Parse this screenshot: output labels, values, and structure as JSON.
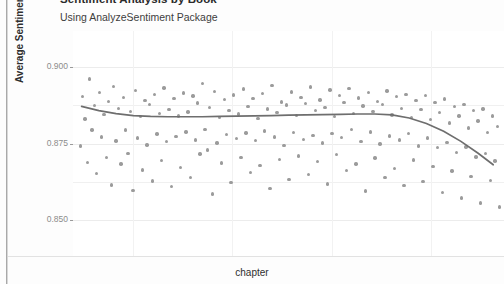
{
  "figure": {
    "title": "Sentiment Analysis by Book",
    "subtitle": "Using AnalyzeSentiment Package",
    "x_axis_label": "chapter",
    "y_axis_label": "Average Sentiment"
  },
  "chart_data": {
    "type": "scatter",
    "title": "Sentiment Analysis by Book",
    "subtitle": "Using AnalyzeSentiment Package",
    "xlabel": "chapter",
    "ylabel": "Average Sentiment",
    "grid": true,
    "legend": "none",
    "xlim": [
      0,
      1
    ],
    "ylim": [
      0.838,
      0.912
    ],
    "x_tick_labels": [],
    "y_ticks": [
      0.85,
      0.875,
      0.9
    ],
    "y_tick_labels": [
      "0.850",
      "0.875",
      "0.900"
    ],
    "point_color": "#9b9b9b",
    "trend_color": "#6e6e6e",
    "series": [
      {
        "name": "chapter sentiment",
        "type": "scatter",
        "points": [
          [
            0.018,
            0.8742
          ],
          [
            0.022,
            0.8905
          ],
          [
            0.028,
            0.8831
          ],
          [
            0.034,
            0.8688
          ],
          [
            0.039,
            0.8962
          ],
          [
            0.044,
            0.8795
          ],
          [
            0.05,
            0.8874
          ],
          [
            0.055,
            0.8651
          ],
          [
            0.061,
            0.8918
          ],
          [
            0.066,
            0.8772
          ],
          [
            0.072,
            0.8845
          ],
          [
            0.078,
            0.8704
          ],
          [
            0.083,
            0.8889
          ],
          [
            0.089,
            0.8613
          ],
          [
            0.094,
            0.8938
          ],
          [
            0.1,
            0.8758
          ],
          [
            0.105,
            0.8866
          ],
          [
            0.111,
            0.8682
          ],
          [
            0.117,
            0.8901
          ],
          [
            0.122,
            0.8794
          ],
          [
            0.128,
            0.8717
          ],
          [
            0.133,
            0.8855
          ],
          [
            0.139,
            0.8596
          ],
          [
            0.145,
            0.8924
          ],
          [
            0.15,
            0.8768
          ],
          [
            0.156,
            0.8839
          ],
          [
            0.161,
            0.8663
          ],
          [
            0.167,
            0.8892
          ],
          [
            0.172,
            0.8745
          ],
          [
            0.178,
            0.8878
          ],
          [
            0.184,
            0.8627
          ],
          [
            0.189,
            0.8911
          ],
          [
            0.195,
            0.8781
          ],
          [
            0.2,
            0.8849
          ],
          [
            0.206,
            0.8694
          ],
          [
            0.211,
            0.8933
          ],
          [
            0.217,
            0.8756
          ],
          [
            0.223,
            0.8862
          ],
          [
            0.228,
            0.8608
          ],
          [
            0.234,
            0.8897
          ],
          [
            0.239,
            0.8773
          ],
          [
            0.245,
            0.8841
          ],
          [
            0.25,
            0.8671
          ],
          [
            0.256,
            0.8916
          ],
          [
            0.262,
            0.8788
          ],
          [
            0.267,
            0.8854
          ],
          [
            0.273,
            0.8639
          ],
          [
            0.278,
            0.8906
          ],
          [
            0.284,
            0.8762
          ],
          [
            0.289,
            0.8883
          ],
          [
            0.295,
            0.8716
          ],
          [
            0.301,
            0.8948
          ],
          [
            0.306,
            0.8797
          ],
          [
            0.312,
            0.8729
          ],
          [
            0.317,
            0.8869
          ],
          [
            0.323,
            0.8584
          ],
          [
            0.328,
            0.8922
          ],
          [
            0.334,
            0.8751
          ],
          [
            0.34,
            0.8836
          ],
          [
            0.345,
            0.8686
          ],
          [
            0.351,
            0.8894
          ],
          [
            0.356,
            0.8779
          ],
          [
            0.362,
            0.8858
          ],
          [
            0.367,
            0.8622
          ],
          [
            0.373,
            0.8909
          ],
          [
            0.379,
            0.8766
          ],
          [
            0.384,
            0.8847
          ],
          [
            0.39,
            0.8703
          ],
          [
            0.395,
            0.8929
          ],
          [
            0.401,
            0.8784
          ],
          [
            0.406,
            0.8871
          ],
          [
            0.412,
            0.8655
          ],
          [
            0.418,
            0.8898
          ],
          [
            0.423,
            0.8759
          ],
          [
            0.429,
            0.8833
          ],
          [
            0.434,
            0.8677
          ],
          [
            0.44,
            0.8914
          ],
          [
            0.445,
            0.8791
          ],
          [
            0.451,
            0.8864
          ],
          [
            0.457,
            0.8601
          ],
          [
            0.462,
            0.8941
          ],
          [
            0.468,
            0.8771
          ],
          [
            0.473,
            0.8852
          ],
          [
            0.479,
            0.8698
          ],
          [
            0.484,
            0.8887
          ],
          [
            0.49,
            0.8744
          ],
          [
            0.496,
            0.8876
          ],
          [
            0.501,
            0.8632
          ],
          [
            0.507,
            0.8919
          ],
          [
            0.512,
            0.8786
          ],
          [
            0.518,
            0.8843
          ],
          [
            0.523,
            0.8709
          ],
          [
            0.529,
            0.8902
          ],
          [
            0.535,
            0.8763
          ],
          [
            0.54,
            0.8881
          ],
          [
            0.546,
            0.8648
          ],
          [
            0.551,
            0.8936
          ],
          [
            0.557,
            0.8777
          ],
          [
            0.562,
            0.8859
          ],
          [
            0.568,
            0.8691
          ],
          [
            0.573,
            0.8893
          ],
          [
            0.579,
            0.8752
          ],
          [
            0.585,
            0.8868
          ],
          [
            0.59,
            0.8617
          ],
          [
            0.596,
            0.8926
          ],
          [
            0.601,
            0.8782
          ],
          [
            0.607,
            0.8838
          ],
          [
            0.612,
            0.8714
          ],
          [
            0.618,
            0.8908
          ],
          [
            0.623,
            0.8769
          ],
          [
            0.629,
            0.8885
          ],
          [
            0.635,
            0.8661
          ],
          [
            0.64,
            0.8931
          ],
          [
            0.646,
            0.8796
          ],
          [
            0.651,
            0.8848
          ],
          [
            0.657,
            0.8683
          ],
          [
            0.662,
            0.8899
          ],
          [
            0.668,
            0.8757
          ],
          [
            0.673,
            0.8873
          ],
          [
            0.679,
            0.8594
          ],
          [
            0.685,
            0.8917
          ],
          [
            0.69,
            0.8788
          ],
          [
            0.696,
            0.8856
          ],
          [
            0.701,
            0.8702
          ],
          [
            0.707,
            0.8889
          ],
          [
            0.712,
            0.8748
          ],
          [
            0.718,
            0.8878
          ],
          [
            0.724,
            0.8639
          ],
          [
            0.729,
            0.8923
          ],
          [
            0.735,
            0.8775
          ],
          [
            0.74,
            0.8844
          ],
          [
            0.746,
            0.8668
          ],
          [
            0.751,
            0.8904
          ],
          [
            0.757,
            0.8761
          ],
          [
            0.762,
            0.8866
          ],
          [
            0.768,
            0.8612
          ],
          [
            0.773,
            0.8912
          ],
          [
            0.779,
            0.8783
          ],
          [
            0.785,
            0.8835
          ],
          [
            0.79,
            0.8696
          ],
          [
            0.796,
            0.8891
          ],
          [
            0.801,
            0.8742
          ],
          [
            0.807,
            0.8861
          ],
          [
            0.812,
            0.8626
          ],
          [
            0.818,
            0.8907
          ],
          [
            0.823,
            0.8768
          ],
          [
            0.829,
            0.8829
          ],
          [
            0.835,
            0.8674
          ],
          [
            0.84,
            0.8884
          ],
          [
            0.846,
            0.8736
          ],
          [
            0.851,
            0.8852
          ],
          [
            0.857,
            0.8588
          ],
          [
            0.862,
            0.8896
          ],
          [
            0.868,
            0.8754
          ],
          [
            0.873,
            0.8818
          ],
          [
            0.879,
            0.8659
          ],
          [
            0.885,
            0.8872
          ],
          [
            0.89,
            0.8721
          ],
          [
            0.896,
            0.8841
          ],
          [
            0.901,
            0.8571
          ],
          [
            0.907,
            0.8879
          ],
          [
            0.912,
            0.8738
          ],
          [
            0.918,
            0.8801
          ],
          [
            0.923,
            0.8642
          ],
          [
            0.929,
            0.8858
          ],
          [
            0.935,
            0.8706
          ],
          [
            0.94,
            0.8824
          ],
          [
            0.946,
            0.8554
          ],
          [
            0.951,
            0.8863
          ],
          [
            0.957,
            0.8717
          ],
          [
            0.962,
            0.8786
          ],
          [
            0.968,
            0.8628
          ],
          [
            0.973,
            0.8841
          ],
          [
            0.979,
            0.8692
          ],
          [
            0.985,
            0.8806
          ],
          [
            0.99,
            0.8541
          ]
        ]
      },
      {
        "name": "loess trend",
        "type": "line",
        "points": [
          [
            0.02,
            0.8872
          ],
          [
            0.06,
            0.8858
          ],
          [
            0.1,
            0.8848
          ],
          [
            0.14,
            0.8842
          ],
          [
            0.18,
            0.8839
          ],
          [
            0.22,
            0.8838
          ],
          [
            0.26,
            0.8838
          ],
          [
            0.3,
            0.8838
          ],
          [
            0.34,
            0.8839
          ],
          [
            0.38,
            0.884
          ],
          [
            0.42,
            0.8841
          ],
          [
            0.46,
            0.8842
          ],
          [
            0.5,
            0.8843
          ],
          [
            0.54,
            0.8844
          ],
          [
            0.58,
            0.8845
          ],
          [
            0.62,
            0.8846
          ],
          [
            0.66,
            0.8847
          ],
          [
            0.7,
            0.8847
          ],
          [
            0.74,
            0.8844
          ],
          [
            0.78,
            0.8834
          ],
          [
            0.82,
            0.8816
          ],
          [
            0.86,
            0.879
          ],
          [
            0.9,
            0.8757
          ],
          [
            0.94,
            0.8718
          ],
          [
            0.975,
            0.868
          ]
        ]
      }
    ]
  }
}
